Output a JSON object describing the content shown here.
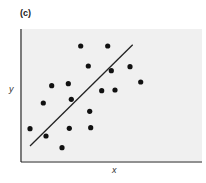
{
  "chart_data": {
    "type": "scatter",
    "title": "(c)",
    "xlabel": "x",
    "ylabel": "y",
    "grid": false,
    "legend": null,
    "points_pixel": [
      [
        80.7,
        46
      ],
      [
        107.7,
        46
      ],
      [
        88.3,
        66
      ],
      [
        111.3,
        70.7
      ],
      [
        130,
        66.7
      ],
      [
        140.7,
        82
      ],
      [
        51.7,
        85.7
      ],
      [
        68.3,
        83.7
      ],
      [
        101.7,
        90.7
      ],
      [
        115,
        90
      ],
      [
        43.3,
        103
      ],
      [
        71.3,
        99.3
      ],
      [
        89.7,
        111.3
      ],
      [
        30,
        128.7
      ],
      [
        69.3,
        128.3
      ],
      [
        90.7,
        127.7
      ],
      [
        46,
        136
      ],
      [
        62,
        147.7
      ]
    ],
    "points": [
      {
        "x": 0.33,
        "y": 0.87
      },
      {
        "x": 0.48,
        "y": 0.87
      },
      {
        "x": 0.37,
        "y": 0.72
      },
      {
        "x": 0.5,
        "y": 0.69
      },
      {
        "x": 0.6,
        "y": 0.72
      },
      {
        "x": 0.66,
        "y": 0.6
      },
      {
        "x": 0.17,
        "y": 0.58
      },
      {
        "x": 0.26,
        "y": 0.59
      },
      {
        "x": 0.45,
        "y": 0.54
      },
      {
        "x": 0.52,
        "y": 0.54
      },
      {
        "x": 0.12,
        "y": 0.45
      },
      {
        "x": 0.28,
        "y": 0.47
      },
      {
        "x": 0.38,
        "y": 0.38
      },
      {
        "x": 0.05,
        "y": 0.25
      },
      {
        "x": 0.26,
        "y": 0.25
      },
      {
        "x": 0.38,
        "y": 0.26
      },
      {
        "x": 0.14,
        "y": 0.19
      },
      {
        "x": 0.23,
        "y": 0.11
      }
    ],
    "fit_line": {
      "x1": 0.05,
      "y1": 0.12,
      "x2": 0.62,
      "y2": 0.88
    },
    "fit_line_pixel": {
      "x1": 30,
      "y1": 146,
      "x2": 132.7,
      "y2": 44.7
    },
    "xlim": [
      0,
      1
    ],
    "ylim": [
      0,
      1
    ],
    "colors": {
      "points": "#111111",
      "line": "#222222",
      "background": "#f0f0f0",
      "axes": "#222222"
    }
  }
}
